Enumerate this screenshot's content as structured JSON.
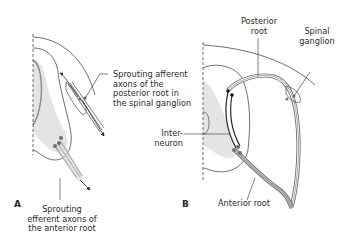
{
  "figure": {
    "panel_a": {
      "letter": "A",
      "labels": {
        "afferent": [
          "Sprouting afferent",
          "axons of the",
          "posterior root in",
          "the spinal ganglion"
        ],
        "efferent": [
          "Sprouting",
          "efferent axons of",
          "the anterior root"
        ]
      }
    },
    "panel_b": {
      "letter": "B",
      "labels": {
        "posterior_root": [
          "Posterior",
          "root"
        ],
        "spinal_ganglion": [
          "Spinal",
          "ganglion"
        ],
        "interneuron": [
          "Inter-",
          "neuron"
        ],
        "anterior_root": [
          "Anterior root"
        ]
      }
    },
    "colors": {
      "outline": "#4a4a4a",
      "gray_matter": "#e4e4e4",
      "nerve": "#6e6e6e",
      "text": "#2b2b2b"
    }
  }
}
